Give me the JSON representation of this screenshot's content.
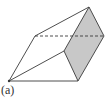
{
  "figure": {
    "label": "(a)",
    "stroke_color": "#3a3a3a",
    "shade_color": "#c8c8c8",
    "vertices": {
      "apex": [
        89,
        7
      ],
      "right": [
        104,
        36
      ],
      "left_top": [
        35,
        36
      ],
      "front_left": [
        9,
        81
      ],
      "front_right": [
        78,
        81
      ],
      "front_mid": [
        64,
        51
      ]
    },
    "solid_edges": [
      [
        "front_left",
        "left_top"
      ],
      [
        "left_top",
        "apex"
      ],
      [
        "front_left",
        "front_right"
      ],
      [
        "front_left",
        "front_mid"
      ],
      [
        "front_mid",
        "apex"
      ],
      [
        "front_mid",
        "front_right"
      ],
      [
        "front_right",
        "right"
      ],
      [
        "apex",
        "right"
      ]
    ],
    "dashed_edges": [
      [
        "left_top",
        "right"
      ]
    ],
    "shaded_face": [
      "apex",
      "right",
      "front_right",
      "front_mid"
    ]
  }
}
